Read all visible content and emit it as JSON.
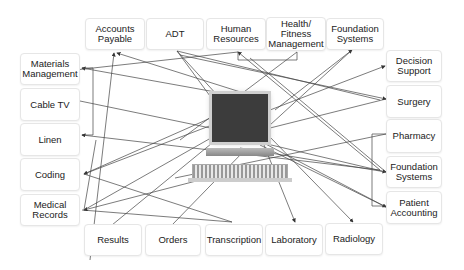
{
  "diagram": {
    "center": {
      "icon": "desktop-computer-icon"
    },
    "top": [
      {
        "label": "Accounts\nPayable"
      },
      {
        "label": "ADT"
      },
      {
        "label": "Human\nResources"
      },
      {
        "label": "Health/\nFitness\nManagement"
      },
      {
        "label": "Foundation\nSystems"
      }
    ],
    "left": [
      {
        "label": "Materials\nManagement"
      },
      {
        "label": "Cable TV"
      },
      {
        "label": "Linen"
      },
      {
        "label": "Coding"
      },
      {
        "label": "Medical\nRecords"
      }
    ],
    "right": [
      {
        "label": "Decision\nSupport"
      },
      {
        "label": "Surgery"
      },
      {
        "label": "Pharmacy"
      },
      {
        "label": "Foundation\nSystems"
      },
      {
        "label": "Patient\nAccounting"
      }
    ],
    "bottom": [
      {
        "label": "Results"
      },
      {
        "label": "Orders"
      },
      {
        "label": "Transcription"
      },
      {
        "label": "Laboratory"
      },
      {
        "label": "Radiology"
      }
    ],
    "colors": {
      "line": "#333333",
      "box_border": "#e6e6e6",
      "monitor": "#3c3c3c"
    }
  }
}
